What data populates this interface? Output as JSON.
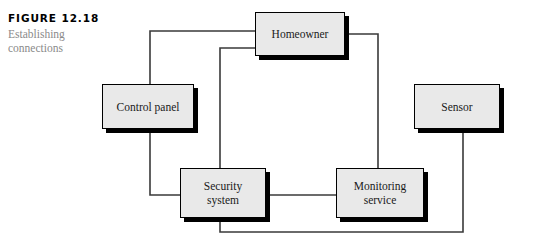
{
  "figure": {
    "number": "FIGURE 12.18",
    "title_line1": "Establishing",
    "title_line2": "connections",
    "number_color": "#000000",
    "title_color": "#8a8a8a"
  },
  "diagram": {
    "type": "block-diagram",
    "background": "#ffffff",
    "node_fill": "#e9e9e9",
    "node_border": "#000000",
    "node_shadow": "#000000",
    "line_color": "#3a3a3a",
    "nodes": [
      {
        "id": "homeowner",
        "label": "Homeowner",
        "x": 255,
        "y": 12,
        "w": 90,
        "h": 44
      },
      {
        "id": "control-panel",
        "label": "Control panel",
        "x": 102,
        "y": 84,
        "w": 92,
        "h": 45
      },
      {
        "id": "sensor",
        "label": "Sensor",
        "x": 414,
        "y": 84,
        "w": 86,
        "h": 45
      },
      {
        "id": "security",
        "label": "Security\nsystem",
        "x": 180,
        "y": 168,
        "w": 86,
        "h": 50
      },
      {
        "id": "monitoring",
        "label": "Monitoring\nservice",
        "x": 336,
        "y": 168,
        "w": 88,
        "h": 50
      }
    ],
    "connections": [
      {
        "id": "homeowner-control-panel",
        "from": "homeowner",
        "to": "control-panel"
      },
      {
        "id": "homeowner-security",
        "from": "homeowner",
        "to": "security"
      },
      {
        "id": "homeowner-monitoring",
        "from": "homeowner",
        "to": "monitoring"
      },
      {
        "id": "control-panel-security",
        "from": "control-panel",
        "to": "security"
      },
      {
        "id": "security-monitoring",
        "from": "security",
        "to": "monitoring"
      },
      {
        "id": "security-sensor",
        "from": "security",
        "to": "sensor"
      }
    ]
  }
}
